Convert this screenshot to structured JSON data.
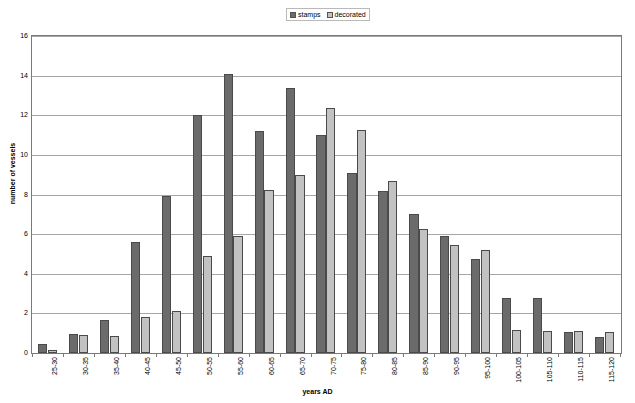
{
  "chart_data": {
    "type": "bar",
    "title": "",
    "xlabel": "years AD",
    "ylabel": "number of vessels",
    "ylim": [
      0,
      16
    ],
    "ytick_step": 2,
    "yticks": [
      "0",
      "2",
      "4",
      "6",
      "8",
      "10",
      "12",
      "14",
      "16"
    ],
    "grid": true,
    "legend_position": "top-center",
    "categories": [
      "25-30",
      "30-35",
      "35-40",
      "40-45",
      "45-50",
      "50-55",
      "55-60",
      "60-65",
      "65-70",
      "70-75",
      "75-80",
      "80-85",
      "85-90",
      "90-95",
      "95-100",
      "100-105",
      "105-110",
      "110-115",
      "115-120"
    ],
    "series": [
      {
        "name": "stamps",
        "color": "#6b6b6b",
        "values": [
          0.45,
          0.95,
          1.65,
          5.6,
          7.9,
          12.0,
          14.1,
          11.2,
          13.4,
          11.0,
          9.1,
          8.2,
          7.0,
          5.9,
          4.75,
          2.8,
          2.8,
          1.05,
          0.8
        ]
      },
      {
        "name": "decorated",
        "color": "#c2c2c2",
        "values": [
          0.15,
          0.9,
          0.85,
          1.8,
          2.1,
          4.9,
          5.9,
          8.25,
          9.0,
          12.35,
          11.25,
          8.7,
          6.25,
          5.45,
          5.2,
          1.15,
          1.1,
          1.1,
          1.05
        ]
      }
    ]
  },
  "legend": {
    "entries": [
      {
        "label": "stamps"
      },
      {
        "label": "decorated"
      }
    ]
  },
  "colors": {
    "stamps": "#6b6b6b",
    "decorated": "#c2c2c2",
    "gridline": "#a6a6a6",
    "axis": "#7a7a7a",
    "background": "#ffffff"
  }
}
